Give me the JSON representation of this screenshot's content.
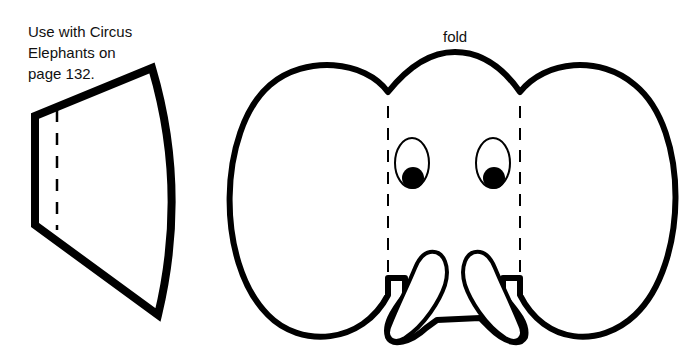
{
  "instructions": {
    "lines": [
      "Use with Circus",
      "Elephants on",
      "page 132."
    ]
  },
  "elephant_face": {
    "fold_label": "fold"
  },
  "colors": {
    "outline": "#000000",
    "background": "#ffffff",
    "text": "#111111"
  },
  "parts": {
    "trunk_piece": "trapezoid-cutout-with-dashed-fold",
    "face_piece": "elephant-head-with-ears-eyes-tusks"
  }
}
